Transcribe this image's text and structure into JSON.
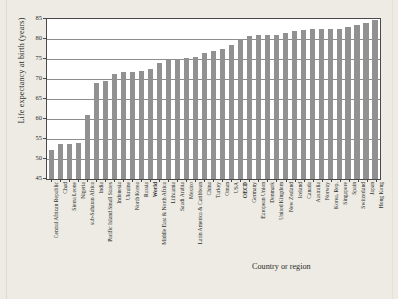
{
  "chart_data": {
    "type": "bar",
    "title": "",
    "xlabel": "Country or region",
    "ylabel": "Life expectancy at birth (years)",
    "ylim": [
      45,
      85
    ],
    "ytick_labels": [
      "85",
      "80",
      "75",
      "70",
      "65",
      "60",
      "55",
      "50",
      "45"
    ],
    "ytick_values": [
      85,
      80,
      75,
      70,
      65,
      60,
      55,
      50,
      45
    ],
    "grid": "horizontal",
    "legend": "none",
    "bar_color": "#919191",
    "plot_background": "#ffffff",
    "page_background": "#edebe4",
    "highlighted_categories": [
      "World",
      "OECD"
    ],
    "categories": [
      "Central African Republic",
      "Chad",
      "Sierra Leone",
      "Nigeria",
      "sub-Saharan Africa",
      "India",
      "Pacific Island Small States",
      "Indonesia",
      "Ukraine",
      "North Korea",
      "Russia",
      "World",
      "Middle East & North Africa",
      "Lithuania",
      "Saudi Arabia",
      "Mexico",
      "Latin America & Caribbean",
      "China",
      "Turkey",
      "Oman",
      "USA",
      "OECD",
      "Germany",
      "European Union",
      "Denmark",
      "United Kingdom",
      "New Zealand",
      "Iceland",
      "Canada",
      "Australia",
      "Norway",
      "Korea, Rep.",
      "Singapore",
      "Spain",
      "Switzerland",
      "Japan",
      "Hong Kong"
    ],
    "values": [
      52.2,
      53.7,
      53.8,
      54.0,
      60.9,
      69.1,
      69.6,
      71.2,
      71.7,
      71.8,
      72.1,
      72.4,
      73.9,
      74.7,
      75.1,
      75.2,
      75.4,
      76.4,
      77.1,
      77.4,
      78.5,
      79.9,
      80.8,
      80.9,
      80.9,
      81.0,
      81.6,
      82.1,
      82.2,
      82.5,
      82.4,
      82.4,
      82.6,
      83.1,
      83.6,
      84.1,
      84.7
    ]
  }
}
